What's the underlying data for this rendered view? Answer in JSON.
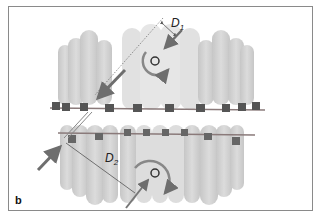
{
  "figure": {
    "panel_label": "b",
    "labels": {
      "d1_main": "D",
      "d1_sub": "1",
      "d2_main": "D",
      "d2_sub": "2"
    },
    "colors": {
      "tooth": "#c4c4c4",
      "tooth_light": "#dedede",
      "wire": "#8a7a7a",
      "arrow": "#6e6e6e",
      "frame": "#8a8a8a",
      "text": "#222222"
    },
    "elements": [
      "upper-arch-teeth",
      "lower-arch-teeth",
      "upper-archwire-with-brackets",
      "lower-archwire-with-brackets",
      "upper-center-of-rotation",
      "lower-center-of-rotation",
      "upper-rotation-arrow",
      "lower-rotation-arrow",
      "upper-force-arrow",
      "lower-force-arrow",
      "d1-moment-arm",
      "d2-moment-arm"
    ]
  }
}
